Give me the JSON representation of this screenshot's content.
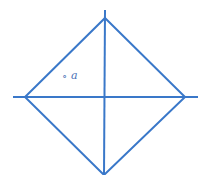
{
  "diagram": {
    "type": "rhombus-with-diagonals",
    "stroke_color": "#3a78c9",
    "vertices": {
      "top": [
        105,
        18
      ],
      "left": [
        25,
        97
      ],
      "right": [
        185,
        97
      ],
      "bottom": [
        104,
        175
      ]
    },
    "horizontal_axis": [
      13,
      97,
      198,
      97
    ],
    "vertical_axis": [
      105,
      10,
      104,
      175
    ],
    "label": {
      "text": "a",
      "marker": "∘",
      "x": 62,
      "y": 70
    }
  }
}
